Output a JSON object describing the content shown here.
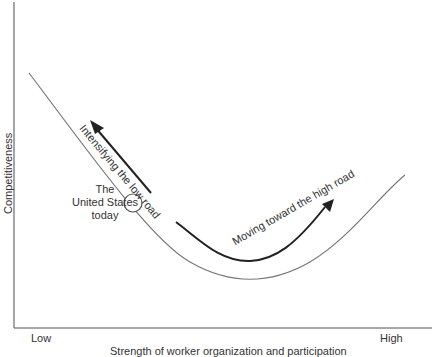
{
  "diagram": {
    "type": "conceptual-curve",
    "y_axis_label": "Competitiveness",
    "x_axis_label": "Strength of worker organization and participation",
    "x_low_label": "Low",
    "x_high_label": "High",
    "point_label_lines": [
      "The",
      "United States",
      "today"
    ],
    "arrow_left_label": "Intensifying the low road",
    "arrow_right_label": "Moving toward the high road"
  }
}
